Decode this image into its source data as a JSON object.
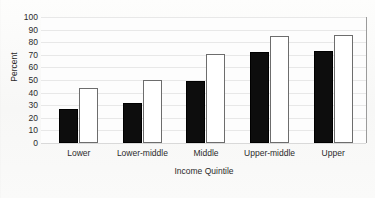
{
  "chart_data": {
    "type": "bar",
    "title": "",
    "xlabel": "Income Quintile",
    "ylabel": "Percent",
    "categories": [
      "Lower",
      "Lower-middle",
      "Middle",
      "Upper-middle",
      "Upper"
    ],
    "series": [
      {
        "name": "series-a",
        "color": "#0d0d0d",
        "values": [
          27,
          32,
          49,
          72,
          73
        ]
      },
      {
        "name": "series-b",
        "color": "#ffffff",
        "values": [
          44,
          50,
          71,
          85,
          85.5
        ]
      }
    ],
    "ylim": [
      0,
      100
    ],
    "yticks": [
      100,
      90,
      80,
      70,
      60,
      50,
      40,
      30,
      20,
      10,
      0
    ],
    "ytick_labels": [
      "100",
      "90",
      "80",
      "70",
      "60",
      "50",
      "40",
      "30",
      "20",
      "10",
      "0"
    ],
    "grid": true,
    "grid_orientation": "horizontal",
    "legend": false,
    "legend_position": "none",
    "grouping": "clustered"
  }
}
